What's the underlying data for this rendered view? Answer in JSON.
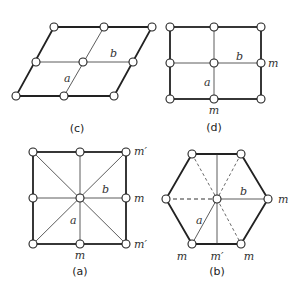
{
  "panels": {
    "c": {
      "caption": "(c)",
      "label_a": "a",
      "label_b": "b"
    },
    "d": {
      "caption": "(d)",
      "label_a": "a",
      "label_b": "b",
      "mirror_right": "m",
      "mirror_bottom": "m"
    },
    "a": {
      "caption": "(a)",
      "label_a": "a",
      "label_b": "b",
      "mirror_top_right": "m′",
      "mirror_right": "m",
      "mirror_bottom_right": "m′",
      "mirror_bottom": "m"
    },
    "b": {
      "caption": "(b)",
      "label_a": "a",
      "label_b": "b",
      "mirror_right": "m",
      "mirror_bottom_left": "m",
      "mirror_bottom_mid": "m′",
      "mirror_bottom_right": "m"
    }
  }
}
